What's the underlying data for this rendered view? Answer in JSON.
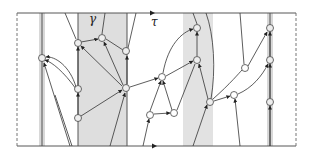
{
  "diagram": {
    "labels": {
      "gamma": "γ",
      "tau": "τ"
    },
    "colors": {
      "band": "#dcdcdc",
      "line": "#333333",
      "node_fill": "#ffffff",
      "node_stroke": "#444444",
      "dashed": "#666666"
    },
    "frame": {
      "left": 17,
      "right": 296,
      "top": 13,
      "bottom": 146
    },
    "bands": [
      {
        "x": 39,
        "w": 6
      },
      {
        "x": 78,
        "w": 49
      },
      {
        "x": 183,
        "w": 30
      },
      {
        "x": 267,
        "w": 6
      }
    ],
    "vertical_lines": [
      42,
      78,
      127,
      270
    ],
    "nodes": [
      {
        "id": "a",
        "x": 42,
        "y": 58
      },
      {
        "id": "b",
        "x": 78,
        "y": 43
      },
      {
        "id": "c",
        "x": 102,
        "y": 38
      },
      {
        "id": "d",
        "x": 126,
        "y": 51
      },
      {
        "id": "e",
        "x": 77,
        "y": 89
      },
      {
        "id": "f",
        "x": 78,
        "y": 118
      },
      {
        "id": "g",
        "x": 126,
        "y": 88
      },
      {
        "id": "h",
        "x": 197,
        "y": 28
      },
      {
        "id": "i",
        "x": 197,
        "y": 60
      },
      {
        "id": "j",
        "x": 162,
        "y": 77
      },
      {
        "id": "k",
        "x": 150,
        "y": 115
      },
      {
        "id": "l",
        "x": 174,
        "y": 113
      },
      {
        "id": "m",
        "x": 210,
        "y": 102
      },
      {
        "id": "n",
        "x": 234,
        "y": 95
      },
      {
        "id": "o",
        "x": 270,
        "y": 28
      },
      {
        "id": "p",
        "x": 270,
        "y": 60
      },
      {
        "id": "q",
        "x": 270,
        "y": 102
      },
      {
        "id": "r",
        "x": 245,
        "y": 68
      },
      {
        "id": "s",
        "x": 140,
        "y": 128
      }
    ]
  }
}
